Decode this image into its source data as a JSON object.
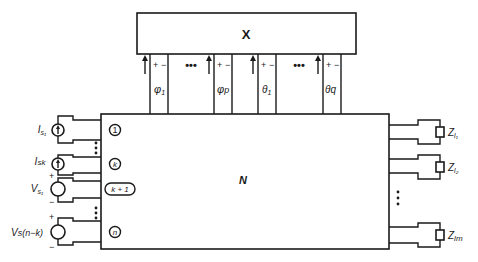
{
  "diagram": {
    "top_box_label": "X",
    "network_label": "N",
    "ellipsis": "•••",
    "top_ports": [
      {
        "label": "φ",
        "sub": "1",
        "plus": "+",
        "minus": "−"
      },
      {
        "label": "φ",
        "sub": "p",
        "plus": "+",
        "minus": "−"
      },
      {
        "label": "θ",
        "sub": "1",
        "plus": "+",
        "minus": "−"
      },
      {
        "label": "θ",
        "sub": "q",
        "plus": "+",
        "minus": "−"
      }
    ],
    "left_ports": [
      {
        "port": "1",
        "source_type": "current",
        "label": "I",
        "sub": "s₁"
      },
      {
        "port": "k",
        "source_type": "current",
        "label": "I",
        "sub": "sk"
      },
      {
        "port": "k + 1",
        "source_type": "voltage",
        "label": "V",
        "sub": "s₁",
        "plus": "+",
        "minus": "−"
      },
      {
        "port": "n",
        "source_type": "voltage",
        "label": "V",
        "sub": "s(n−k)",
        "plus": "+",
        "minus": "−"
      }
    ],
    "right_loads": [
      {
        "label": "Z",
        "sub": "l₁"
      },
      {
        "label": "Z",
        "sub": "l₂"
      },
      {
        "label": "Z",
        "sub": "lm"
      }
    ],
    "colors": {
      "line": "#1a1a1a",
      "background": "#ffffff"
    }
  }
}
